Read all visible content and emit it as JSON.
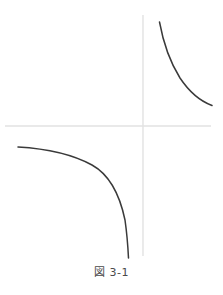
{
  "figure": {
    "caption": "図 3-1",
    "background_color": "#ffffff"
  },
  "chart_data": {
    "type": "line",
    "title": "図 3-1",
    "subtitle": "",
    "xlabel": "",
    "ylabel": "",
    "grid": false,
    "legend_position": "none",
    "axis_color": "#e2e2e2",
    "curve_color": "#3a3a3a",
    "curve_width": 1.5,
    "origin_px": {
      "x": 143,
      "y": 126
    },
    "axes": [
      {
        "name": "x-axis",
        "orientation": "horizontal",
        "x1": 5,
        "y1": 126,
        "x2": 211,
        "y2": 126
      },
      {
        "name": "y-axis",
        "orientation": "vertical",
        "x1": 143,
        "y1": 15,
        "x2": 143,
        "y2": 256
      }
    ],
    "series": [
      {
        "name": "branch-upper-right",
        "quadrant": "I",
        "path": "M 159.5 22 C 163.5 44, 170 62, 180 78 C 190 93, 200 101, 212 105.5",
        "endpoints": [
          {
            "x": 159.5,
            "y": 22
          },
          {
            "x": 212,
            "y": 105.5
          }
        ]
      },
      {
        "name": "branch-lower-left",
        "quadrant": "III",
        "path": "M 18 147 C 44 148.5, 70 153, 92 165 C 110 175, 120 196, 125 220 C 127 234, 128 248, 128.5 258",
        "endpoints": [
          {
            "x": 18,
            "y": 147
          },
          {
            "x": 128.5,
            "y": 258
          }
        ]
      }
    ]
  }
}
